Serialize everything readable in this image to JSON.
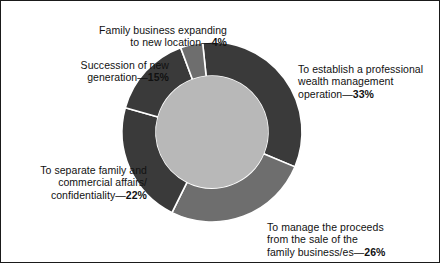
{
  "figure": {
    "background_color": "#ffffff",
    "border_color": "#1a1a1a",
    "text_color": "#111111"
  },
  "chart_data": {
    "type": "pie",
    "variant": "donut",
    "title": "",
    "subtitle": "",
    "xlabel": "",
    "ylabel": "",
    "legend_position": "none",
    "grid": false,
    "units": "percent",
    "total": 100,
    "start_angle_deg": -96,
    "direction": "clockwise",
    "hole_fraction": 0.62,
    "center": {
      "x": 211,
      "y": 131
    },
    "outer_radius": 90,
    "inner_radius": 56,
    "inner_circle_color": "#b8b8b8",
    "separator_color": "#ffffff",
    "categories": [
      "To establish a professional wealth management operation",
      "To manage the proceeds from the sale of the family business/es",
      "To separate family and commercial affairs/confidentiality",
      "Succession of new generation",
      "Family business expanding to new location"
    ],
    "values": [
      33,
      26,
      22,
      15,
      4
    ],
    "colors": [
      "#3a3a3a",
      "#6e6e6e",
      "#3a3a3a",
      "#3a3a3a",
      "#6e6e6e"
    ],
    "slices": [
      {
        "name": "establish-professional-wealth-management",
        "label": "To establish a professional\nwealth management\noperation",
        "value": 33,
        "value_text": "33%",
        "separator": "—",
        "color": "#3a3a3a"
      },
      {
        "name": "manage-proceeds-sale-family-business",
        "label": "To manage the proceeds\nfrom the sale of the\nfamily business/es",
        "value": 26,
        "value_text": "26%",
        "separator": "—",
        "color": "#6e6e6e"
      },
      {
        "name": "separate-family-commercial-affairs",
        "label": "To separate family and\ncommercial affairs/\nconfidentiality",
        "value": 22,
        "value_text": "22%",
        "separator": "—",
        "color": "#3a3a3a"
      },
      {
        "name": "succession-of-new-generation",
        "label": "Succession of new\ngeneration",
        "value": 15,
        "value_text": "15%",
        "separator": "—",
        "color": "#3a3a3a"
      },
      {
        "name": "family-business-expanding-new-location",
        "label": "Family business expanding\nto new location",
        "value": 4,
        "value_text": "4%",
        "separator": "—",
        "color": "#6e6e6e"
      }
    ]
  }
}
